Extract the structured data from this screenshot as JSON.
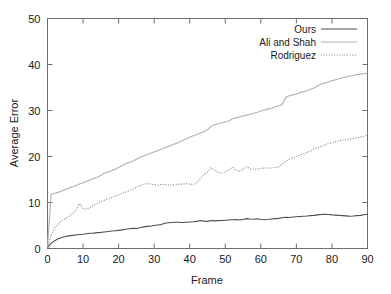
{
  "chart_data": {
    "type": "line",
    "title": "",
    "xlabel": "Frame",
    "ylabel": "Average Error",
    "xlim": [
      0,
      90
    ],
    "ylim": [
      0,
      50
    ],
    "xticks": [
      0,
      10,
      20,
      30,
      40,
      50,
      60,
      70,
      80,
      90
    ],
    "yticks": [
      0,
      10,
      20,
      30,
      40,
      50
    ],
    "grid": false,
    "legend_position": "top-right-inside",
    "x": [
      0,
      1,
      2,
      3,
      4,
      5,
      6,
      7,
      8,
      9,
      10,
      11,
      12,
      13,
      14,
      15,
      16,
      17,
      18,
      19,
      20,
      21,
      22,
      23,
      24,
      25,
      26,
      27,
      28,
      29,
      30,
      31,
      32,
      33,
      34,
      35,
      36,
      37,
      38,
      39,
      40,
      41,
      42,
      43,
      44,
      45,
      46,
      47,
      48,
      49,
      50,
      51,
      52,
      53,
      54,
      55,
      56,
      57,
      58,
      59,
      60,
      61,
      62,
      63,
      64,
      65,
      66,
      67,
      68,
      69,
      70,
      71,
      72,
      73,
      74,
      75,
      76,
      77,
      78,
      79,
      80,
      81,
      82,
      83,
      84,
      85,
      86,
      87,
      88,
      89,
      90
    ],
    "series": [
      {
        "name": "Ours",
        "style": "solid",
        "color": "#4d4d4d",
        "width": 1.1,
        "values": [
          0.2,
          1.1,
          1.7,
          2.1,
          2.4,
          2.6,
          2.75,
          2.85,
          2.95,
          3.05,
          3.1,
          3.2,
          3.3,
          3.35,
          3.45,
          3.5,
          3.6,
          3.7,
          3.8,
          3.85,
          3.95,
          4.05,
          4.2,
          4.3,
          4.4,
          4.35,
          4.5,
          4.7,
          4.8,
          4.85,
          5.0,
          5.1,
          5.2,
          5.5,
          5.6,
          5.65,
          5.7,
          5.7,
          5.65,
          5.7,
          5.75,
          5.8,
          5.9,
          6.1,
          5.95,
          5.9,
          6.1,
          6.0,
          6.05,
          6.1,
          6.15,
          6.2,
          6.25,
          6.3,
          6.2,
          6.3,
          6.5,
          6.4,
          6.35,
          6.45,
          6.3,
          6.25,
          6.3,
          6.4,
          6.5,
          6.55,
          6.7,
          6.8,
          6.75,
          6.85,
          6.9,
          6.95,
          7.0,
          7.05,
          7.15,
          7.2,
          7.3,
          7.4,
          7.45,
          7.4,
          7.3,
          7.25,
          7.2,
          7.15,
          7.1,
          7.0,
          7.05,
          7.15,
          7.2,
          7.35,
          7.45
        ]
      },
      {
        "name": "Ali and Shah",
        "style": "solid",
        "color": "#b0b0b0",
        "width": 1.1,
        "values": [
          0.3,
          11.8,
          12.0,
          12.2,
          12.5,
          12.8,
          13.1,
          13.4,
          13.7,
          14.0,
          14.3,
          14.6,
          14.9,
          15.2,
          15.5,
          15.9,
          16.4,
          16.6,
          16.9,
          17.2,
          17.6,
          18.0,
          18.4,
          18.7,
          19.0,
          19.4,
          19.8,
          20.1,
          20.4,
          20.7,
          21.0,
          21.3,
          21.6,
          21.9,
          22.2,
          22.5,
          22.8,
          23.1,
          23.5,
          23.8,
          24.2,
          24.5,
          24.8,
          25.1,
          25.4,
          25.8,
          26.6,
          26.9,
          27.1,
          27.3,
          27.5,
          27.7,
          28.2,
          28.4,
          28.6,
          28.8,
          29.0,
          29.2,
          29.4,
          29.6,
          29.9,
          30.1,
          30.3,
          30.5,
          30.8,
          31.0,
          31.3,
          32.9,
          33.2,
          33.4,
          33.6,
          33.9,
          34.1,
          34.3,
          34.6,
          34.9,
          35.4,
          35.7,
          36.0,
          36.2,
          36.5,
          36.7,
          36.9,
          37.1,
          37.3,
          37.5,
          37.6,
          37.8,
          37.9,
          38.0,
          38.1
        ]
      },
      {
        "name": "Rodriguez",
        "style": "dotted",
        "color": "#808080",
        "width": 1.1,
        "values": [
          0.2,
          3.0,
          4.4,
          5.3,
          6.0,
          6.5,
          7.0,
          7.5,
          8.3,
          9.8,
          8.7,
          8.5,
          9.0,
          9.4,
          9.8,
          10.2,
          10.5,
          10.8,
          11.1,
          11.4,
          11.7,
          12.0,
          12.3,
          12.6,
          12.9,
          13.3,
          13.7,
          14.0,
          14.1,
          14.0,
          13.9,
          13.8,
          13.9,
          13.9,
          13.8,
          13.8,
          13.9,
          14.0,
          14.0,
          14.1,
          14.0,
          13.9,
          14.3,
          15.2,
          16.1,
          16.6,
          17.6,
          17.0,
          16.5,
          16.4,
          16.7,
          17.1,
          17.7,
          17.0,
          16.8,
          17.3,
          17.8,
          17.3,
          17.2,
          17.3,
          17.4,
          17.5,
          17.5,
          17.5,
          17.6,
          17.7,
          18.3,
          19.0,
          19.4,
          19.7,
          20.0,
          20.3,
          20.6,
          20.9,
          21.2,
          21.6,
          21.9,
          22.2,
          22.5,
          22.8,
          23.0,
          23.2,
          23.4,
          23.6,
          23.7,
          23.8,
          23.9,
          24.0,
          24.2,
          24.4,
          24.6
        ]
      }
    ]
  },
  "axes": {
    "ylabel": "Average Error",
    "xlabel": "Frame",
    "ytick_labels": [
      "0",
      "10",
      "20",
      "30",
      "40",
      "50"
    ],
    "xtick_labels": [
      "0",
      "10",
      "20",
      "30",
      "40",
      "50",
      "60",
      "70",
      "80",
      "90"
    ]
  },
  "legend": {
    "entries": [
      {
        "label": "Ours",
        "style": "solid",
        "color": "#4d4d4d"
      },
      {
        "label": "Ali and Shah",
        "style": "solid",
        "color": "#b0b0b0"
      },
      {
        "label": "Rodriguez",
        "style": "dotted",
        "color": "#808080"
      }
    ]
  },
  "colors": {
    "axis": "#6e6e6e",
    "text": "#1a1a1a",
    "background": "#ffffff",
    "ours": "#4d4d4d",
    "ali_and_shah": "#b0b0b0",
    "rodriguez": "#808080"
  }
}
